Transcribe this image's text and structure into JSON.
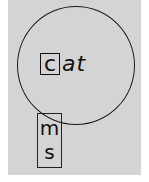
{
  "diagram": {
    "type": "word-slide",
    "wheel": {
      "onset": "c",
      "rime": "at"
    },
    "slide_strip": {
      "letters": [
        "m",
        "s"
      ]
    }
  }
}
